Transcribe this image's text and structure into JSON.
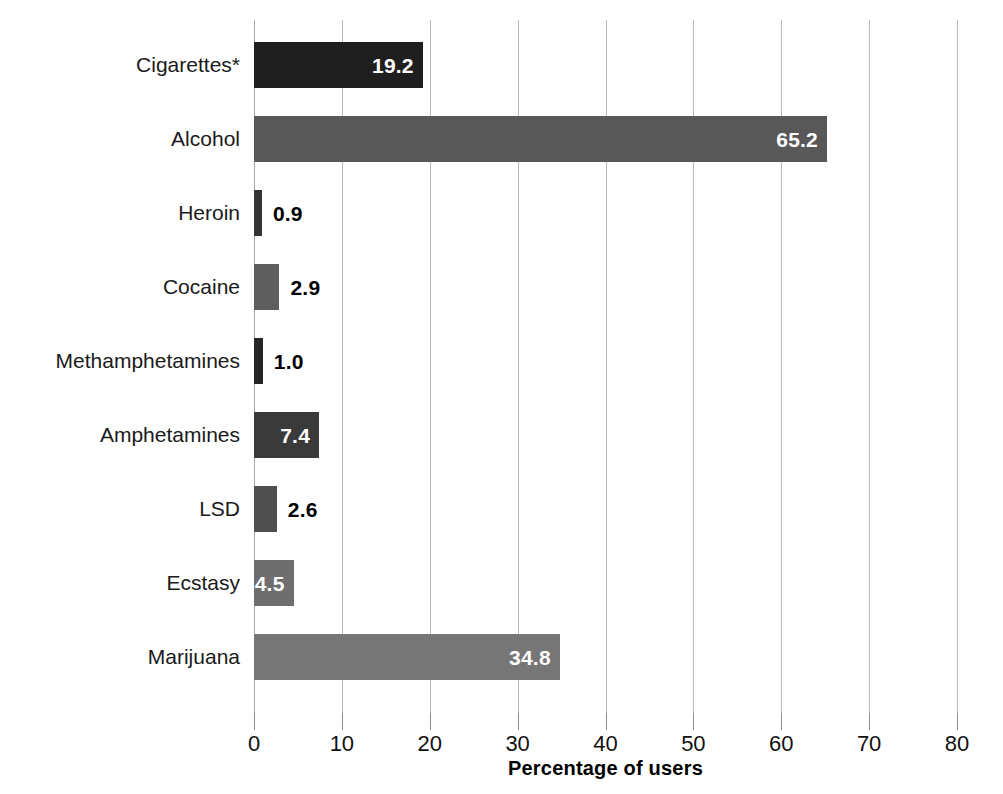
{
  "chart_data": {
    "type": "bar",
    "orientation": "horizontal",
    "title": "",
    "xlabel": "Percentage of users",
    "ylabel": "",
    "xlim": [
      0,
      80
    ],
    "xticks": [
      0,
      10,
      20,
      30,
      40,
      50,
      60,
      70,
      80
    ],
    "xtick_labels": [
      "0",
      "10",
      "20",
      "30",
      "40",
      "50",
      "60",
      "70",
      "80"
    ],
    "grid": "vertical",
    "legend": "none",
    "categories": [
      "Cigarettes*",
      "Alcohol",
      "Heroin",
      "Cocaine",
      "Methamphetamines",
      "Amphetamines",
      "LSD",
      "Ecstasy",
      "Marijuana"
    ],
    "values": [
      19.2,
      65.2,
      0.9,
      2.9,
      1.0,
      7.4,
      2.6,
      4.5,
      34.8
    ],
    "value_labels": [
      "19.2",
      "65.2",
      "0.9",
      "2.9",
      "1.0",
      "7.4",
      "2.6",
      "4.5",
      "34.8"
    ],
    "label_placement": [
      "inside",
      "inside",
      "outside",
      "outside",
      "outside",
      "inside",
      "outside",
      "inside",
      "inside"
    ],
    "bar_colors": [
      "#1f1f1f",
      "#585858",
      "#333333",
      "#5e5e5e",
      "#262626",
      "#3a3a3a",
      "#4f4f4f",
      "#6e6e6e",
      "#767676"
    ],
    "bars": [
      {
        "category": "Cigarettes*",
        "value": 19.2,
        "label": "19.2",
        "color": "#1f1f1f",
        "placement": "inside"
      },
      {
        "category": "Alcohol",
        "value": 65.2,
        "label": "65.2",
        "color": "#585858",
        "placement": "inside"
      },
      {
        "category": "Heroin",
        "value": 0.9,
        "label": "0.9",
        "color": "#333333",
        "placement": "outside"
      },
      {
        "category": "Cocaine",
        "value": 2.9,
        "label": "2.9",
        "color": "#5e5e5e",
        "placement": "outside"
      },
      {
        "category": "Methamphetamines",
        "value": 1.0,
        "label": "1.0",
        "color": "#262626",
        "placement": "outside"
      },
      {
        "category": "Amphetamines",
        "value": 7.4,
        "label": "7.4",
        "color": "#3a3a3a",
        "placement": "inside"
      },
      {
        "category": "LSD",
        "value": 2.6,
        "label": "2.6",
        "color": "#4f4f4f",
        "placement": "outside"
      },
      {
        "category": "Ecstasy",
        "value": 4.5,
        "label": "4.5",
        "color": "#6e6e6e",
        "placement": "inside"
      },
      {
        "category": "Marijuana",
        "value": 34.8,
        "label": "34.8",
        "color": "#767676",
        "placement": "inside"
      }
    ]
  },
  "colors": {
    "background": "#ffffff",
    "gridline": "#b9b9b9",
    "tick": "#8e8e8e",
    "text": "#111111"
  }
}
